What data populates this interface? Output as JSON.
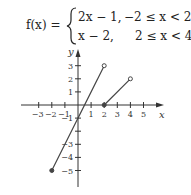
{
  "formula": {
    "lhs": "f(x) =",
    "cases": [
      {
        "expr": "2x − 1,",
        "cond": "−2 ≤ x < 2"
      },
      {
        "expr": "x − 2,",
        "cond": "2 ≤ x < 4"
      }
    ]
  },
  "chart_data": {
    "type": "line",
    "title": "",
    "xlabel": "x",
    "ylabel": "y",
    "xlim": [
      -4,
      6
    ],
    "ylim": [
      -6,
      4
    ],
    "grid": false,
    "x_ticks": [
      -3,
      -2,
      -1,
      1,
      2,
      3,
      4,
      5
    ],
    "x_tick_labels": [
      "−3",
      "−2",
      "−1",
      "1",
      "2",
      "3",
      "4",
      "5"
    ],
    "y_ticks": [
      3,
      2,
      1,
      -1,
      -2,
      -3,
      -4,
      -5
    ],
    "y_tick_labels": [
      "3",
      "2",
      "1",
      "−1",
      "",
      "−3",
      "−4",
      "−5"
    ],
    "series": [
      {
        "name": "2x − 1",
        "x": [
          -2,
          2
        ],
        "y": [
          -5,
          3
        ],
        "start": "closed",
        "end": "open"
      },
      {
        "name": "x − 2",
        "x": [
          2,
          4
        ],
        "y": [
          0,
          2
        ],
        "start": "closed",
        "end": "open"
      }
    ]
  }
}
